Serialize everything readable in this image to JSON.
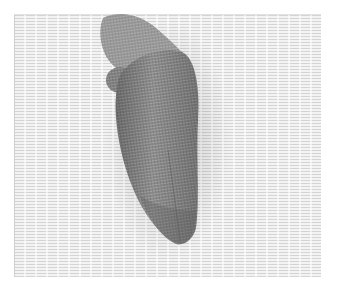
{
  "image": {
    "subject": "woven mesh object on printed text background",
    "colors": {
      "background": "#ffffff",
      "text_sheet": "#f3f3f3",
      "text_lines": "#d4d4d4",
      "object_dark": "#6e6e6e",
      "object_mid": "#8c8c8c",
      "object_light": "#b4b4b4"
    }
  }
}
